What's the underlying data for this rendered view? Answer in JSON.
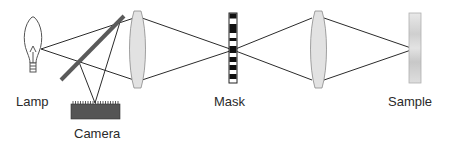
{
  "diagram": {
    "type": "optical-setup",
    "colors": {
      "line": "#2b2b2b",
      "lens_fill": "#e2e2e2",
      "lens_stroke": "#8a8a8a",
      "beam_splitter": "#5a5a5a",
      "camera_body": "#555555",
      "mask_dark": "#111111",
      "sample_fill": "#d8d8d8"
    },
    "components": {
      "lamp": {
        "label": "Lamp"
      },
      "camera": {
        "label": "Camera"
      },
      "mask": {
        "label": "Mask"
      },
      "sample": {
        "label": "Sample"
      }
    }
  }
}
